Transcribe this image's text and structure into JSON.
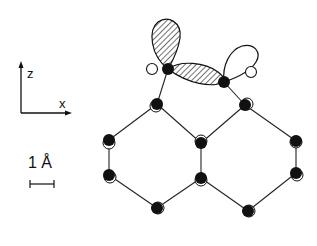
{
  "axes": {
    "z_label": "z",
    "x_label": "x"
  },
  "scale_bar": {
    "label": "1 Å"
  },
  "colors": {
    "ink": "#111111",
    "background": "#ffffff"
  },
  "structure": {
    "description": "Surface dimer with dangling-bond orbitals on hexagonal substrate",
    "dimer_atoms": [
      {
        "x": 168,
        "y": 69,
        "filled": true
      },
      {
        "x": 224,
        "y": 82,
        "filled": true
      }
    ],
    "unrelaxed_positions": [
      {
        "x": 152,
        "y": 69
      },
      {
        "x": 250,
        "y": 73
      }
    ],
    "substrate_atoms": [
      {
        "x": 157,
        "y": 104
      },
      {
        "x": 245,
        "y": 105
      },
      {
        "x": 109,
        "y": 140
      },
      {
        "x": 109,
        "y": 175
      },
      {
        "x": 157,
        "y": 208
      },
      {
        "x": 201,
        "y": 143
      },
      {
        "x": 201,
        "y": 178
      },
      {
        "x": 248,
        "y": 211
      },
      {
        "x": 296,
        "y": 141
      },
      {
        "x": 296,
        "y": 173
      }
    ],
    "orbitals": [
      {
        "name": "dangling-bond-left",
        "hatched": true
      },
      {
        "name": "dimer-bond",
        "hatched": true
      },
      {
        "name": "dangling-bond-right",
        "hatched": false
      }
    ]
  }
}
